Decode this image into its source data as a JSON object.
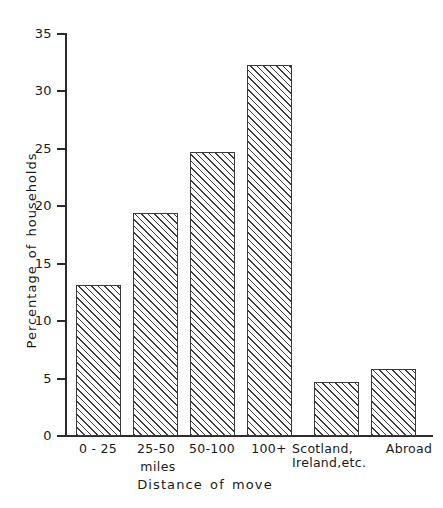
{
  "chart_data": {
    "type": "bar",
    "title": "",
    "xlabel": "Distance of move",
    "ylabel": "Percentage of households",
    "x_sub_label": "miles",
    "categories": [
      "0 - 25",
      "25-50",
      "50-100",
      "100+",
      "Scotland,\nIreland,etc.",
      "Abroad"
    ],
    "values": [
      13.1,
      19.4,
      24.7,
      32.2,
      4.7,
      5.8
    ],
    "ylim": [
      0,
      35
    ],
    "yticks": [
      0,
      5,
      10,
      15,
      20,
      25,
      30,
      35
    ],
    "ytick_labels": [
      "0",
      "5",
      "10",
      "15",
      "20",
      "25",
      "30",
      "35"
    ],
    "grid": false,
    "legend": false,
    "bar_fill": "hatched-diagonal",
    "line_color": "#2b2b2b",
    "background": "#ffffff"
  }
}
